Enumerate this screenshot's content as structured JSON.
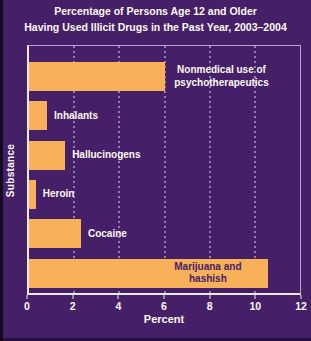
{
  "title": {
    "line1": "Percentage of Persons Age 12 and Older",
    "line2": "Having Used Illicit Drugs in the Past Year, 2003–2004"
  },
  "chart_data": {
    "type": "bar",
    "orientation": "horizontal",
    "title": "Percentage of Persons Age 12 and Older Having Used Illicit Drugs in the Past Year, 2003–2004",
    "xlabel": "Percent",
    "ylabel": "Substance",
    "xlim": [
      0,
      12
    ],
    "xticks": [
      0,
      2,
      4,
      6,
      8,
      10,
      12
    ],
    "grid": "dotted-vertical-white",
    "legend": "none",
    "categories": [
      "Nonmedical use of psychotherapeutics",
      "Inhalants",
      "Hallucinogens",
      "Heroin",
      "Cocaine",
      "Marijuana and hashish"
    ],
    "values": [
      6.0,
      0.8,
      1.6,
      0.3,
      2.3,
      10.6
    ],
    "bar_label_placement": [
      "outside",
      "outside",
      "outside",
      "outside",
      "outside",
      "inside"
    ],
    "colors": {
      "background": "#452069",
      "bar": "#f8b159",
      "text": "#fdf9f0",
      "inside_label_text": "#452069",
      "axis_line": "#efe9dc"
    }
  }
}
